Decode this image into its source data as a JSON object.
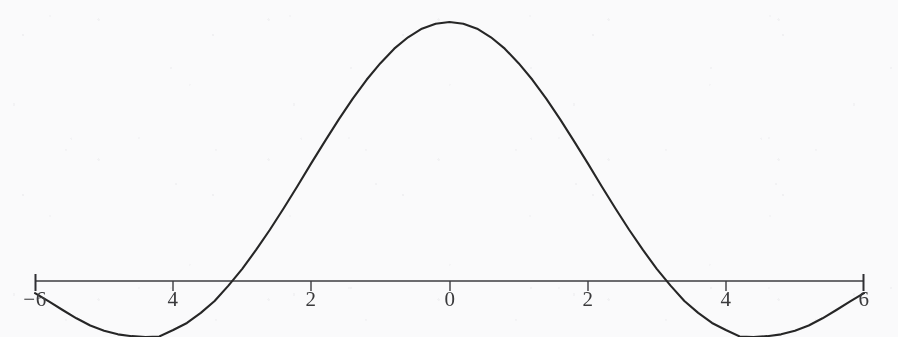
{
  "figure": {
    "title": "",
    "background_color": "#fcfcfd",
    "curve_color": "#262626",
    "axis_color": "#3c3c40",
    "label_color": "#3a3a3c"
  },
  "chart_data": {
    "type": "line",
    "title": "",
    "xlabel": "",
    "ylabel": "",
    "xlim": [
      -6,
      6
    ],
    "ylim": [
      -0.25,
      1.05
    ],
    "grid": false,
    "legend": null,
    "axis": {
      "x_axis_visible": true,
      "y_axis_visible": false,
      "x_ticks": [
        -6,
        -4,
        -2,
        0,
        2,
        4,
        6
      ],
      "x_tick_labels": [
        "−6",
        "4",
        "2",
        "0",
        "2",
        "4",
        "6"
      ],
      "end_caps": [
        "-6",
        "6"
      ]
    },
    "annotations": [
      {
        "text": "peak",
        "x": 0,
        "y": 1.0
      },
      {
        "text": "zero-crossing",
        "x": -3.14,
        "y": 0
      },
      {
        "text": "zero-crossing",
        "x": 3.14,
        "y": 0
      },
      {
        "text": "trough",
        "x": -4.49,
        "y": -0.217
      },
      {
        "text": "trough",
        "x": 4.49,
        "y": -0.217
      }
    ],
    "series": [
      {
        "name": "sinc",
        "x": [
          -6.0,
          -5.8,
          -5.6,
          -5.4,
          -5.2,
          -5.0,
          -4.8,
          -4.6,
          -4.4,
          -4.2,
          -4.0,
          -3.8,
          -3.6,
          -3.4,
          -3.2,
          -3.0,
          -2.8,
          -2.6,
          -2.4,
          -2.2,
          -2.0,
          -1.8,
          -1.6,
          -1.4,
          -1.2,
          -1.0,
          -0.8,
          -0.6,
          -0.4,
          -0.2,
          0.0,
          0.2,
          0.4,
          0.6,
          0.8,
          1.0,
          1.2,
          1.4,
          1.6,
          1.8,
          2.0,
          2.2,
          2.4,
          2.6,
          2.8,
          3.0,
          3.2,
          3.4,
          3.6,
          3.8,
          4.0,
          4.2,
          4.4,
          4.6,
          4.8,
          5.0,
          5.2,
          5.4,
          5.6,
          5.8,
          6.0
        ],
        "y": [
          -0.047,
          -0.079,
          -0.112,
          -0.144,
          -0.172,
          -0.192,
          -0.206,
          -0.213,
          -0.216,
          -0.214,
          -0.189,
          -0.162,
          -0.123,
          -0.077,
          -0.018,
          0.047,
          0.12,
          0.198,
          0.281,
          0.367,
          0.455,
          0.541,
          0.625,
          0.704,
          0.777,
          0.841,
          0.897,
          0.941,
          0.974,
          0.993,
          1.0,
          0.993,
          0.974,
          0.941,
          0.897,
          0.841,
          0.777,
          0.704,
          0.625,
          0.541,
          0.455,
          0.367,
          0.281,
          0.198,
          0.12,
          0.047,
          -0.018,
          -0.077,
          -0.123,
          -0.162,
          -0.189,
          -0.214,
          -0.216,
          -0.213,
          -0.206,
          -0.192,
          -0.172,
          -0.144,
          -0.112,
          -0.079,
          -0.047
        ]
      }
    ]
  },
  "ticks": [
    {
      "label": "−6",
      "x_px": 35,
      "y_px": 296
    },
    {
      "label": "4",
      "x_px": 173,
      "y_px": 296
    },
    {
      "label": "2",
      "x_px": 311,
      "y_px": 296
    },
    {
      "label": "0",
      "x_px": 450,
      "y_px": 296
    },
    {
      "label": "2",
      "x_px": 588,
      "y_px": 296
    },
    {
      "label": "4",
      "x_px": 726,
      "y_px": 296
    },
    {
      "label": "6",
      "x_px": 864,
      "y_px": 296
    }
  ]
}
